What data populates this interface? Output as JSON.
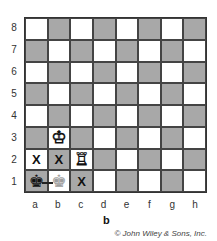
{
  "diagram": {
    "caption": "b",
    "copyright": "© John Wiley & Sons, Inc.",
    "colors": {
      "light_square": "#ffffff",
      "dark_square": "#a8a8a8"
    },
    "ranks": [
      "8",
      "7",
      "6",
      "5",
      "4",
      "3",
      "2",
      "1"
    ],
    "files": [
      "a",
      "b",
      "c",
      "d",
      "e",
      "f",
      "g",
      "h"
    ],
    "pieces": [
      {
        "square": "b3",
        "piece": "white-king",
        "glyph": "♔"
      },
      {
        "square": "c2",
        "piece": "white-rook",
        "glyph": "♖"
      },
      {
        "square": "a1",
        "piece": "black-king",
        "glyph": "♚"
      },
      {
        "square": "b1",
        "piece": "ghost-king",
        "glyph": "♚"
      }
    ],
    "marks": [
      {
        "square": "a2",
        "label": "X"
      },
      {
        "square": "b2",
        "label": "X"
      },
      {
        "square": "c1",
        "label": "X"
      }
    ],
    "arrows": [
      {
        "from": "a1",
        "to": "b1"
      }
    ]
  }
}
